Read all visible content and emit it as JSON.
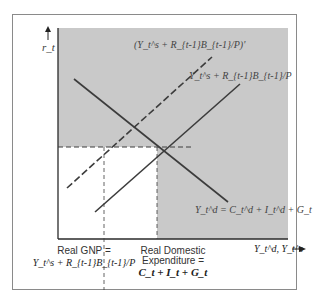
{
  "diagram": {
    "type": "supply-demand",
    "axes": {
      "y_label": "r_t",
      "x_label": "Y_t^d, Y_t^s"
    },
    "curves": [
      {
        "id": "supply-shifted",
        "style": "dashed",
        "label": "(Y_t^s + R_{t-1}B_{t-1}/P)'"
      },
      {
        "id": "supply",
        "style": "solid",
        "label": "Y_t^s + R_{t-1}B_{t-1}/P"
      },
      {
        "id": "demand",
        "style": "solid",
        "label": "Y_t^d = C_t^d + I_t^d + G_t"
      }
    ],
    "annotations": {
      "gnp": {
        "title": "Real GNP =",
        "formula": "Y_t^s + R_{t-1}B_{t-1}/P"
      },
      "domestic": {
        "line1": "Real Domestic",
        "line2": "Expenditure =",
        "formula": "C_t + I_t + G_t"
      }
    },
    "colors": {
      "shaded_region": "#c9c9c9",
      "line": "#3c3c3c",
      "frame": "#8a8a8a"
    }
  }
}
